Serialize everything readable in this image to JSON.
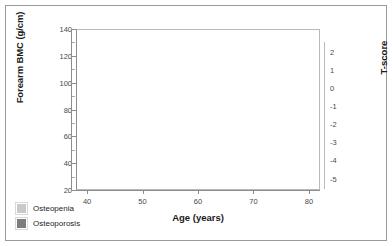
{
  "chart_data": {
    "type": "line",
    "title": "",
    "subtitle": "",
    "xlabel": "Age (years)",
    "ylabel": "Forearm BMC (g/cm)",
    "y2label": "T-score",
    "xlim": [
      38,
      82
    ],
    "ylim": [
      20,
      140
    ],
    "y2lim": [
      -5.4,
      2.4
    ],
    "x_ticks": [
      40,
      50,
      60,
      70,
      80
    ],
    "y_ticks": [
      20,
      40,
      60,
      80,
      100,
      120,
      140
    ],
    "y_minor_ticks": [
      30,
      50,
      70,
      90,
      110,
      130
    ],
    "y2_ticks": [
      2,
      1,
      0,
      -1,
      -2,
      -3,
      -4,
      -5
    ],
    "grid": "dotted horizontal gridlines at T-score values",
    "legend_position": "below-left",
    "x": [
      40,
      45,
      50,
      55,
      60,
      65,
      70,
      75,
      80
    ],
    "series": [
      {
        "name": "+2 SD (T-score +2)",
        "tscore_at_80": 0.0,
        "values": [
          123,
          123,
          123,
          123,
          118,
          111,
          105,
          100,
          96
        ]
      },
      {
        "name": "+1 SD (T-score +1)",
        "tscore_at_80": -1.0,
        "values": [
          109,
          109,
          109,
          109,
          104,
          97,
          91,
          86,
          83
        ]
      },
      {
        "name": "Mean (T-score 0)",
        "tscore_at_80": -1.6,
        "values": [
          96,
          96,
          96,
          96,
          91,
          84,
          78,
          74,
          71
        ]
      },
      {
        "name": "-1 SD (T-score -1)",
        "tscore_at_80": -2.3,
        "values": [
          84,
          84,
          84,
          84,
          79,
          72,
          66,
          61,
          58
        ]
      },
      {
        "name": "-2 SD (T-score -2)",
        "tscore_at_80": -3.1,
        "values": [
          70,
          70,
          70,
          70,
          65,
          58,
          52,
          48,
          45
        ]
      },
      {
        "name": "-2.5 SD osteoporosis threshold",
        "tscore_at_80": -4.0,
        "values": [
          59,
          59,
          59,
          59,
          54,
          47,
          41,
          37,
          34
        ]
      }
    ],
    "bands": [
      {
        "name": "Osteopenia",
        "color": "#c9c9c9",
        "upper_series_index": 3,
        "lower_series_index": 5
      },
      {
        "name": "Osteoporosis",
        "color": "#7d7d7d",
        "upper_series_index": 5,
        "lower_bound": 20
      }
    ]
  },
  "legend": {
    "items": [
      {
        "label": "Osteopenia",
        "color": "#c9c9c9"
      },
      {
        "label": "Osteoporosis",
        "color": "#7d7d7d"
      }
    ]
  },
  "colors": {
    "line": "#2b2b2b",
    "osteopenia": "#c9c9c9",
    "osteoporosis": "#7d7d7d",
    "axis": "#8d8d8d",
    "grid": "#bdbdbd",
    "frame": "#9a9a9a",
    "text": "#1a1a1a",
    "tick_text": "#4a4a4a"
  }
}
